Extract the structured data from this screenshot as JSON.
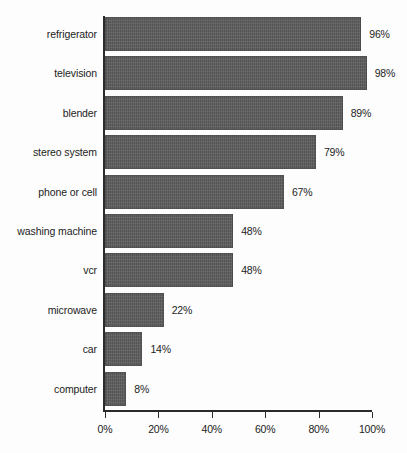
{
  "chart_data": {
    "type": "bar",
    "orientation": "horizontal",
    "title": "",
    "subtitle": "",
    "xlabel": "",
    "ylabel": "",
    "xlim": [
      0,
      100
    ],
    "grid": false,
    "legend": null,
    "xtick_labels": [
      "0%",
      "20%",
      "40%",
      "60%",
      "80%",
      "100%"
    ],
    "xticks": [
      0,
      20,
      40,
      60,
      80,
      100
    ],
    "categories": [
      "refrigerator",
      "television",
      "blender",
      "stereo system",
      "phone or cell",
      "washing machine",
      "vcr",
      "microwave",
      "car",
      "computer"
    ],
    "values": [
      96,
      98,
      89,
      79,
      67,
      48,
      48,
      22,
      14,
      8
    ],
    "value_labels": [
      "96%",
      "98%",
      "89%",
      "79%",
      "67%",
      "48%",
      "48%",
      "22%",
      "14%",
      "8%"
    ],
    "bar_color": "#5d5d5d",
    "axis_color": "#2b2b2b",
    "text_color": "#1c1c1c",
    "background_color": "#fdfdfd"
  }
}
